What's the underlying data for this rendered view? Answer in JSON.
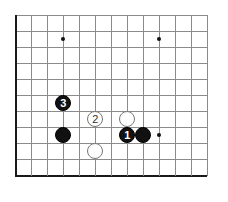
{
  "board": {
    "title": "Go board diagram",
    "grid": {
      "origin_x": 15,
      "origin_y": 15,
      "spacing": 16,
      "cols": 13,
      "rows": 11,
      "line_color": "#8b8b8b",
      "edge_color": "#1a1a1a",
      "background": "#ffffff"
    },
    "star_points": [
      {
        "name": "star-point-upper-left",
        "x": 63,
        "y": 39
      },
      {
        "name": "star-point-upper-right",
        "x": 159,
        "y": 39
      },
      {
        "name": "star-point-lower-right",
        "x": 159,
        "y": 135
      }
    ],
    "stones": [
      {
        "name": "stone-black-move-3",
        "color": "black",
        "label": "3",
        "x": 63,
        "y": 103,
        "d": 16
      },
      {
        "name": "stone-white-move-2",
        "color": "white",
        "label": "2",
        "x": 95,
        "y": 119,
        "d": 16
      },
      {
        "name": "stone-black-plain-left",
        "color": "black",
        "label": "",
        "x": 63,
        "y": 135,
        "d": 16
      },
      {
        "name": "stone-white-plain-lower",
        "color": "white",
        "label": "",
        "x": 95,
        "y": 151,
        "d": 16
      },
      {
        "name": "stone-white-plain-upper",
        "color": "white",
        "label": "",
        "x": 127,
        "y": 119,
        "d": 16
      },
      {
        "name": "stone-black-move-1",
        "color": "black",
        "label": "1",
        "x": 127,
        "y": 135,
        "d": 16
      },
      {
        "name": "stone-black-plain-right",
        "color": "black",
        "label": "",
        "x": 143,
        "y": 135,
        "d": 16
      }
    ]
  }
}
